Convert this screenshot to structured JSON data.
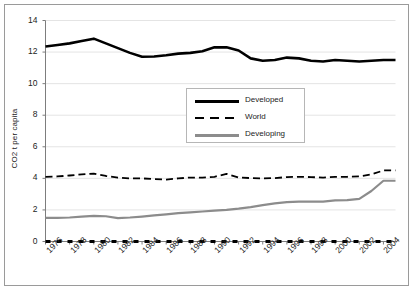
{
  "chart_data": {
    "type": "line",
    "title": "",
    "xlabel": "",
    "ylabel": "CO2 t per capita",
    "xlim": [
      1976,
      2005
    ],
    "ylim": [
      0,
      14
    ],
    "ytick_values": [
      0,
      2,
      4,
      6,
      8,
      10,
      12,
      14
    ],
    "ytick_labels": [
      "0",
      "2",
      "4",
      "6",
      "8",
      "10",
      "12",
      "14"
    ],
    "xtick_labels": [
      "1976",
      "1978",
      "1980",
      "1982",
      "1984",
      "1986",
      "1988",
      "1990",
      "1992",
      "1994",
      "1996",
      "1998",
      "2000",
      "2002",
      "2004"
    ],
    "xtick_values": [
      1976,
      1978,
      1980,
      1982,
      1984,
      1986,
      1988,
      1990,
      1992,
      1994,
      1996,
      1998,
      2000,
      2002,
      2004
    ],
    "x": [
      1976,
      1977,
      1978,
      1979,
      1980,
      1981,
      1982,
      1983,
      1984,
      1985,
      1986,
      1987,
      1988,
      1989,
      1990,
      1991,
      1992,
      1993,
      1994,
      1995,
      1996,
      1997,
      1998,
      1999,
      2000,
      2001,
      2002,
      2003,
      2004,
      2005
    ],
    "grid": "horizontal",
    "legend_position": "center",
    "series": [
      {
        "name": "Developed",
        "color": "#000000",
        "style": "solid",
        "width": 2.6,
        "values": [
          12.35,
          12.45,
          12.55,
          12.7,
          12.85,
          12.55,
          12.25,
          11.95,
          11.7,
          11.72,
          11.8,
          11.9,
          11.95,
          12.05,
          12.3,
          12.3,
          12.1,
          11.6,
          11.45,
          11.5,
          11.65,
          11.6,
          11.45,
          11.4,
          11.5,
          11.45,
          11.4,
          11.45,
          11.5,
          11.5
        ]
      },
      {
        "name": "World",
        "color": "#000000",
        "style": "dashed",
        "width": 1.8,
        "values": [
          4.1,
          4.12,
          4.18,
          4.25,
          4.3,
          4.15,
          4.05,
          4.0,
          4.0,
          3.95,
          3.92,
          4.0,
          4.05,
          4.05,
          4.1,
          4.28,
          4.05,
          4.02,
          4.0,
          4.02,
          4.08,
          4.1,
          4.08,
          4.05,
          4.1,
          4.1,
          4.12,
          4.25,
          4.5,
          4.5
        ]
      },
      {
        "name": "Developing",
        "color": "#8c8c8c",
        "style": "solid",
        "width": 2.2,
        "values": [
          1.5,
          1.5,
          1.52,
          1.58,
          1.62,
          1.6,
          1.48,
          1.52,
          1.58,
          1.65,
          1.72,
          1.8,
          1.85,
          1.9,
          1.95,
          2.0,
          2.08,
          2.18,
          2.3,
          2.42,
          2.5,
          2.52,
          2.52,
          2.53,
          2.6,
          2.62,
          2.7,
          3.2,
          3.85,
          3.85
        ]
      },
      {
        "name": "baseline",
        "color": "#000000",
        "style": "dashed-thick",
        "width": 3.0,
        "values": [
          0,
          0,
          0,
          0,
          0,
          0,
          0,
          0,
          0,
          0,
          0,
          0,
          0,
          0,
          0,
          0,
          0,
          0,
          0,
          0,
          0,
          0,
          0,
          0,
          0,
          0,
          0,
          0,
          0,
          0
        ]
      }
    ],
    "legend_entries": [
      {
        "label": "Developed",
        "color": "#000000",
        "style": "solid"
      },
      {
        "label": "World",
        "color": "#000000",
        "style": "dashed"
      },
      {
        "label": "Developing",
        "color": "#8c8c8c",
        "style": "solid"
      }
    ]
  }
}
